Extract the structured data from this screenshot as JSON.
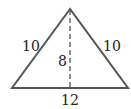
{
  "diagram": {
    "type": "isosceles-triangle",
    "stroke_color": "#555555",
    "labels": {
      "left_side": "10",
      "right_side": "10",
      "height": "8",
      "base": "12"
    },
    "vertices": {
      "apex": [
        70,
        9
      ],
      "base_left": [
        12,
        88
      ],
      "base_right": [
        128,
        88
      ]
    }
  }
}
